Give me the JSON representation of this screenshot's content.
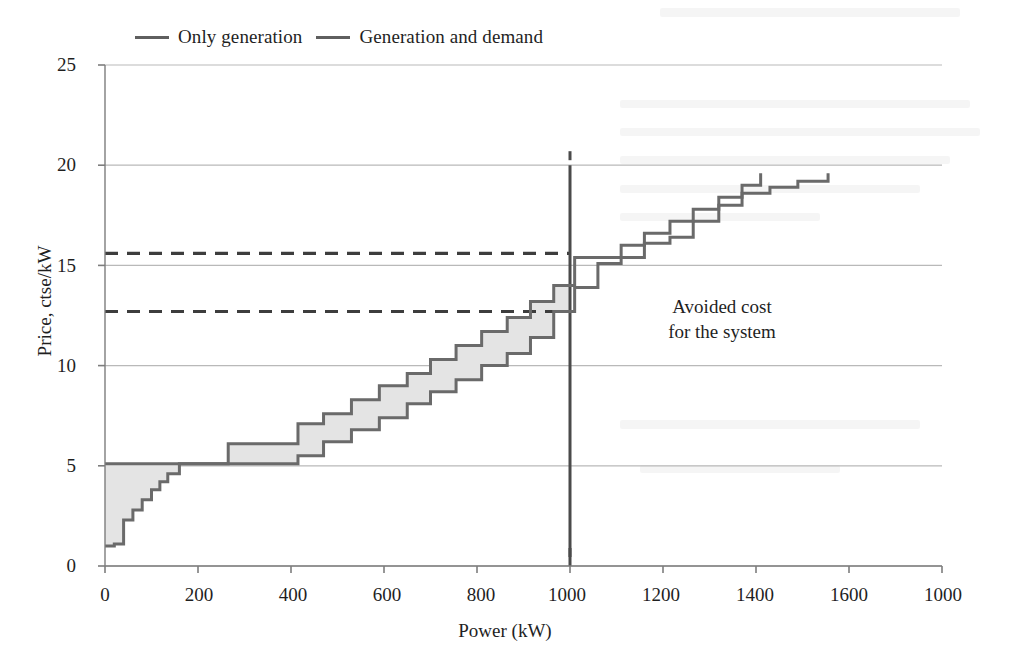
{
  "legend": {
    "position": "top",
    "items": [
      {
        "label": "Only generation",
        "color": "#5f5f5f"
      },
      {
        "label": "Generation and demand",
        "color": "#5f5f5f"
      }
    ]
  },
  "annotation": {
    "line1": "Avoided cost",
    "line2": "for the system"
  },
  "axes": {
    "ylabel": "Price, ctse/kW",
    "xlabel": "Power (kW)",
    "yticks": [
      "0",
      "5",
      "10",
      "15",
      "20",
      "25"
    ],
    "xticks": [
      "0",
      "200",
      "400",
      "600",
      "800",
      "1000",
      "1200",
      "1400",
      "1600",
      "1000"
    ]
  },
  "colors": {
    "line": "#6a6a6a",
    "fill": "#e4e4e4",
    "grid": "#b9b9b9",
    "axis": "#7d7d7d",
    "text": "#1f1f1f",
    "marker": "#4a4a4a"
  },
  "chart_data": {
    "type": "line",
    "title": "",
    "xlabel": "Power (kW)",
    "ylabel": "Price, ctse/kW",
    "xlim": [
      0,
      1800
    ],
    "ylim": [
      0,
      25
    ],
    "grid": true,
    "legend_position": "top",
    "step_style": "post",
    "series": [
      {
        "name": "Only generation",
        "color": "#6a6a6a",
        "x": [
          0,
          160,
          265,
          320,
          415,
          470,
          530,
          590,
          650,
          700,
          755,
          810,
          865,
          915,
          965,
          1010,
          1060,
          1110,
          1160,
          1215,
          1265,
          1320,
          1370,
          1410
        ],
        "values": [
          5.1,
          5.1,
          6.1,
          6.1,
          7.1,
          7.6,
          8.3,
          9.0,
          9.6,
          10.3,
          11.0,
          11.7,
          12.4,
          13.2,
          14.0,
          15.4,
          15.4,
          16.0,
          16.6,
          17.2,
          17.8,
          18.4,
          19.0,
          19.6
        ]
      },
      {
        "name": "Generation and demand",
        "color": "#6a6a6a",
        "x": [
          0,
          20,
          40,
          60,
          80,
          100,
          118,
          135,
          160,
          265,
          320,
          415,
          470,
          530,
          590,
          650,
          700,
          755,
          810,
          865,
          915,
          965,
          1010,
          1060,
          1110,
          1160,
          1215,
          1265,
          1320,
          1370,
          1430,
          1490,
          1555
        ],
        "values": [
          1.0,
          1.1,
          2.3,
          2.8,
          3.3,
          3.8,
          4.2,
          4.6,
          5.1,
          5.1,
          5.1,
          5.5,
          6.2,
          6.8,
          7.4,
          8.1,
          8.7,
          9.3,
          10.0,
          10.6,
          11.4,
          12.7,
          13.9,
          15.1,
          15.4,
          16.1,
          16.4,
          17.2,
          18.0,
          18.6,
          18.9,
          19.2,
          19.6
        ]
      }
    ],
    "reference_lines": [
      {
        "type": "horizontal",
        "value": 15.6,
        "style": "dashed",
        "label": "price with only generation at 1000 kW"
      },
      {
        "type": "horizontal",
        "value": 12.7,
        "style": "dashed",
        "label": "price with generation and demand at 1000 kW"
      },
      {
        "type": "vertical",
        "value": 1000,
        "style": "solid",
        "label": "operating point"
      }
    ],
    "shaded_region": {
      "label": "Avoided cost for the system",
      "between": [
        "Only generation",
        "Generation and demand"
      ],
      "x_range": [
        0,
        1000
      ],
      "fill": "#e4e4e4"
    }
  }
}
